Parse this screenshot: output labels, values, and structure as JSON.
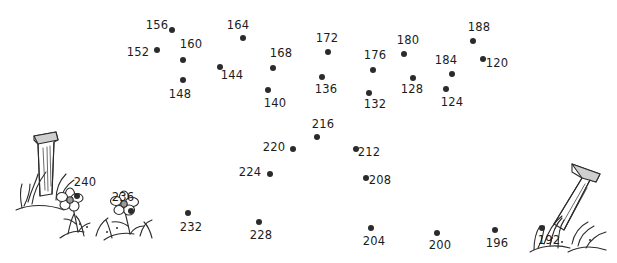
{
  "page": {
    "background_color": "#ffffff",
    "dot_color": "#2b2b2b",
    "label_color": "#1c1c1c"
  },
  "artwork": {
    "left": {
      "name": "fence-post-with-flowers-and-grass",
      "description": "wooden fence post with two daisy flowers and grass tufts"
    },
    "right": {
      "name": "fence-post-with-grass",
      "description": "wooden fence post with grass tufts"
    }
  },
  "dots": [
    {
      "label": "156",
      "lx": 157,
      "ly": 25,
      "px": 172,
      "py": 30
    },
    {
      "label": "152",
      "lx": 138,
      "ly": 52,
      "px": 157,
      "py": 50
    },
    {
      "label": "160",
      "lx": 191,
      "ly": 44,
      "px": 183,
      "py": 60
    },
    {
      "label": "148",
      "lx": 180,
      "ly": 94,
      "px": 183,
      "py": 80
    },
    {
      "label": "164",
      "lx": 238,
      "ly": 25,
      "px": 243,
      "py": 38
    },
    {
      "label": "144",
      "lx": 232,
      "ly": 75,
      "px": 220,
      "py": 67
    },
    {
      "label": "168",
      "lx": 281,
      "ly": 53,
      "px": 273,
      "py": 68
    },
    {
      "label": "172",
      "lx": 327,
      "ly": 38,
      "px": 328,
      "py": 52
    },
    {
      "label": "176",
      "lx": 375,
      "ly": 55,
      "px": 373,
      "py": 70
    },
    {
      "label": "180",
      "lx": 408,
      "ly": 40,
      "px": 404,
      "py": 54
    },
    {
      "label": "188",
      "lx": 479,
      "ly": 27,
      "px": 473,
      "py": 41
    },
    {
      "label": "184",
      "lx": 446,
      "ly": 60,
      "px": 452,
      "py": 74
    },
    {
      "label": "120",
      "lx": 497,
      "ly": 63,
      "px": 483,
      "py": 59
    },
    {
      "label": "128",
      "lx": 412,
      "ly": 89,
      "px": 413,
      "py": 78
    },
    {
      "label": "124",
      "lx": 452,
      "ly": 102,
      "px": 446,
      "py": 89
    },
    {
      "label": "132",
      "lx": 375,
      "ly": 104,
      "px": 369,
      "py": 93
    },
    {
      "label": "136",
      "lx": 326,
      "ly": 89,
      "px": 322,
      "py": 77
    },
    {
      "label": "140",
      "lx": 275,
      "ly": 103,
      "px": 268,
      "py": 90
    },
    {
      "label": "216",
      "lx": 323,
      "ly": 124,
      "px": 317,
      "py": 137
    },
    {
      "label": "220",
      "lx": 274,
      "ly": 147,
      "px": 293,
      "py": 149
    },
    {
      "label": "212",
      "lx": 369,
      "ly": 152,
      "px": 356,
      "py": 149
    },
    {
      "label": "224",
      "lx": 250,
      "ly": 172,
      "px": 270,
      "py": 174
    },
    {
      "label": "208",
      "lx": 380,
      "ly": 180,
      "px": 366,
      "py": 178
    },
    {
      "label": "240",
      "lx": 85,
      "ly": 182,
      "px": 77,
      "py": 196
    },
    {
      "label": "236",
      "lx": 123,
      "ly": 197,
      "px": 131,
      "py": 211
    },
    {
      "label": "232",
      "lx": 191,
      "ly": 227,
      "px": 188,
      "py": 213
    },
    {
      "label": "228",
      "lx": 261,
      "ly": 235,
      "px": 259,
      "py": 222
    },
    {
      "label": "204",
      "lx": 374,
      "ly": 241,
      "px": 371,
      "py": 228
    },
    {
      "label": "200",
      "lx": 440,
      "ly": 245,
      "px": 437,
      "py": 233
    },
    {
      "label": "196",
      "lx": 497,
      "ly": 243,
      "px": 495,
      "py": 230
    },
    {
      "label": "192",
      "lx": 549,
      "ly": 240,
      "px": 542,
      "py": 228
    }
  ]
}
